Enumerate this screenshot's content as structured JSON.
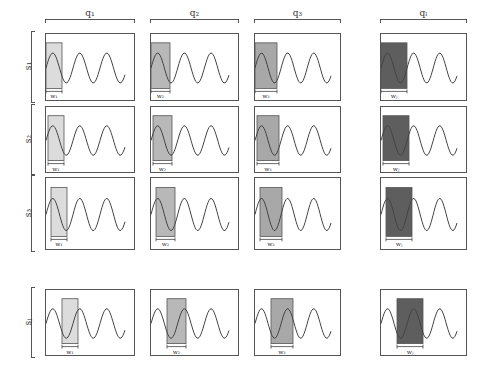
{
  "columns": [
    {
      "label": "q₁",
      "shade": "#dcdcdc",
      "window_label": "w₁",
      "window_width": 16
    },
    {
      "label": "q₂",
      "shade": "#b8b8b8",
      "window_label": "w₂",
      "window_width": 19
    },
    {
      "label": "q₃",
      "shade": "#a8a8a8",
      "window_label": "w₃",
      "window_width": 22
    },
    {
      "label": "qₗ",
      "shade": "#5e5e5e",
      "window_label": "wⱼ",
      "window_width": 26
    }
  ],
  "rows": [
    {
      "label": "s₁",
      "window_offset": 0
    },
    {
      "label": "s₂",
      "window_offset": 2
    },
    {
      "label": "s₃",
      "window_offset": 5
    },
    {
      "label": "sⱼ",
      "window_offset": 16
    }
  ],
  "layout": {
    "col_x": [
      45,
      150,
      254,
      380
    ],
    "col_w": [
      90,
      89,
      87,
      87
    ],
    "row_y": [
      33,
      106,
      177,
      289
    ],
    "row_h": [
      68,
      67,
      73,
      67
    ]
  }
}
